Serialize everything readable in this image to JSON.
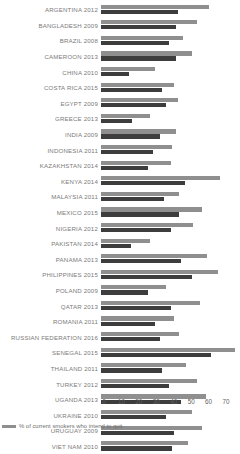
{
  "chart_data": {
    "type": "bar",
    "orientation": "horizontal",
    "title": "",
    "xlabel": "",
    "ylabel": "",
    "xlim": [
      0,
      78
    ],
    "grid": false,
    "legend_position": "bottom-left",
    "axis_ticks": [
      "0",
      "10",
      "20",
      "30",
      "40",
      "50",
      "60",
      "70"
    ],
    "categories": [
      "ARGENTINA 2012",
      "BANGLADESH 2009",
      "BRAZIL 2008",
      "CAMEROON 2013",
      "CHINA 2010",
      "COSTA RICA 2015",
      "EGYPT 2009",
      "GREECE 2013",
      "INDIA 2009",
      "INDONESIA 2011",
      "KAZAKHSTAN 2014",
      "KENYA 2014",
      "MALAYSIA 2011",
      "MEXICO 2015",
      "NIGERIA 2012",
      "PAKISTAN 2014",
      "PANAMA 2013",
      "PHILIPPINES 2015",
      "POLAND 2009",
      "QATAR 2013",
      "ROMANIA 2011",
      "RUSSIAN FEDERATION 2016",
      "SENEGAL 2015",
      "THAILAND 2011",
      "TURKEY 2012",
      "UGANDA 2013",
      "UKRAINE 2010",
      "URUGUAY 2009",
      "VIET NAM 2010"
    ],
    "series": [
      {
        "name": "% of current smokers who intend to quit",
        "color": "#8f8f8f",
        "values": [
          62,
          55,
          47,
          52,
          31,
          42,
          44,
          28,
          43,
          41,
          40,
          68,
          45,
          58,
          53,
          28,
          61,
          67,
          37,
          57,
          42,
          45,
          77,
          49,
          55,
          60,
          52,
          58,
          50
        ]
      },
      {
        "name": "% of current smokers who tried to quit",
        "color": "#3d3d3d",
        "values": [
          44,
          43,
          39,
          43,
          16,
          35,
          37,
          18,
          34,
          30,
          27,
          48,
          36,
          45,
          40,
          17,
          46,
          52,
          27,
          40,
          31,
          34,
          63,
          35,
          39,
          46,
          37,
          42,
          41
        ]
      }
    ],
    "legend": [
      {
        "label": "% of current smokers who intend to quit",
        "color": "#8f8f8f"
      }
    ]
  }
}
